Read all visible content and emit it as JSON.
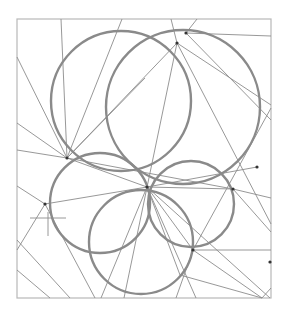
{
  "diagram": {
    "type": "geometric-construction",
    "frame": {
      "x": 17,
      "y": 19,
      "width": 254,
      "height": 279,
      "stroke": "#b8b8b8"
    },
    "colors": {
      "circle": "#8a8a8a",
      "line": "#8c8c8c",
      "point": "#333333"
    },
    "points": [
      {
        "id": "A",
        "x": 177,
        "y": 43
      },
      {
        "id": "B",
        "x": 147,
        "y": 187
      },
      {
        "id": "C",
        "x": 67,
        "y": 158
      },
      {
        "id": "D",
        "x": 45,
        "y": 204
      },
      {
        "id": "E",
        "x": 233,
        "y": 189
      },
      {
        "id": "F",
        "x": 193,
        "y": 250
      },
      {
        "id": "G",
        "x": 186,
        "y": 33
      },
      {
        "id": "H",
        "x": 270,
        "y": 262
      },
      {
        "id": "I",
        "x": 257,
        "y": 167
      }
    ],
    "circles": [
      {
        "id": "c1",
        "cx": 121,
        "cy": 101,
        "r": 70
      },
      {
        "id": "c2",
        "cx": 183,
        "cy": 107,
        "r": 77
      },
      {
        "id": "c3",
        "cx": 100,
        "cy": 203,
        "r": 50
      },
      {
        "id": "c4",
        "cx": 191,
        "cy": 204,
        "r": 43
      },
      {
        "id": "c5",
        "cx": 141,
        "cy": 242,
        "r": 52
      }
    ],
    "lines": [
      {
        "x1": 61,
        "y1": 19,
        "x2": 67,
        "y2": 158
      },
      {
        "x1": 17,
        "y1": 57,
        "x2": 67,
        "y2": 158
      },
      {
        "x1": 17,
        "y1": 123,
        "x2": 67,
        "y2": 158
      },
      {
        "x1": 17,
        "y1": 150,
        "x2": 67,
        "y2": 158
      },
      {
        "x1": 122,
        "y1": 19,
        "x2": 67,
        "y2": 158
      },
      {
        "x1": 145,
        "y1": 78,
        "x2": 67,
        "y2": 158
      },
      {
        "x1": 67,
        "y1": 158,
        "x2": 177,
        "y2": 43
      },
      {
        "x1": 67,
        "y1": 158,
        "x2": 147,
        "y2": 187
      },
      {
        "x1": 67,
        "y1": 158,
        "x2": 233,
        "y2": 189
      },
      {
        "x1": 171,
        "y1": 19,
        "x2": 177,
        "y2": 43
      },
      {
        "x1": 197,
        "y1": 19,
        "x2": 186,
        "y2": 33
      },
      {
        "x1": 186,
        "y1": 33,
        "x2": 271,
        "y2": 36
      },
      {
        "x1": 186,
        "y1": 33,
        "x2": 271,
        "y2": 120
      },
      {
        "x1": 177,
        "y1": 43,
        "x2": 271,
        "y2": 105
      },
      {
        "x1": 177,
        "y1": 43,
        "x2": 271,
        "y2": 224
      },
      {
        "x1": 177,
        "y1": 43,
        "x2": 124,
        "y2": 298
      },
      {
        "x1": 271,
        "y1": 108,
        "x2": 193,
        "y2": 250
      },
      {
        "x1": 257,
        "y1": 167,
        "x2": 147,
        "y2": 187
      },
      {
        "x1": 147,
        "y1": 187,
        "x2": 233,
        "y2": 189
      },
      {
        "x1": 233,
        "y1": 189,
        "x2": 271,
        "y2": 198
      },
      {
        "x1": 233,
        "y1": 189,
        "x2": 271,
        "y2": 232
      },
      {
        "x1": 147,
        "y1": 187,
        "x2": 45,
        "y2": 204
      },
      {
        "x1": 147,
        "y1": 187,
        "x2": 193,
        "y2": 250
      },
      {
        "x1": 147,
        "y1": 187,
        "x2": 180,
        "y2": 275
      },
      {
        "x1": 147,
        "y1": 187,
        "x2": 270,
        "y2": 298
      },
      {
        "x1": 147,
        "y1": 187,
        "x2": 196,
        "y2": 298
      },
      {
        "x1": 147,
        "y1": 187,
        "x2": 101,
        "y2": 298
      },
      {
        "x1": 193,
        "y1": 250,
        "x2": 271,
        "y2": 250
      },
      {
        "x1": 193,
        "y1": 250,
        "x2": 262,
        "y2": 298
      },
      {
        "x1": 193,
        "y1": 250,
        "x2": 176,
        "y2": 298
      },
      {
        "x1": 180,
        "y1": 275,
        "x2": 262,
        "y2": 298
      },
      {
        "x1": 17,
        "y1": 250,
        "x2": 45,
        "y2": 204
      },
      {
        "x1": 17,
        "y1": 186,
        "x2": 45,
        "y2": 204
      },
      {
        "x1": 45,
        "y1": 204,
        "x2": 95,
        "y2": 298
      },
      {
        "x1": 17,
        "y1": 240,
        "x2": 70,
        "y2": 298
      },
      {
        "x1": 17,
        "y1": 270,
        "x2": 50,
        "y2": 298
      },
      {
        "x1": 30,
        "y1": 218,
        "x2": 66,
        "y2": 218
      },
      {
        "x1": 48,
        "y1": 212,
        "x2": 48,
        "y2": 236
      },
      {
        "x1": 262,
        "y1": 298,
        "x2": 271,
        "y2": 288
      }
    ]
  }
}
